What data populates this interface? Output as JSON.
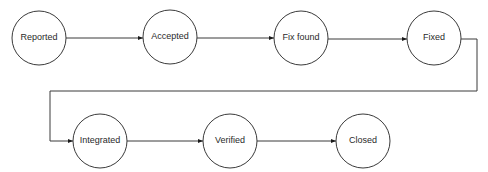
{
  "diagram": {
    "type": "state-flow",
    "nodes": [
      {
        "id": "reported",
        "label": "Reported",
        "cx": 39,
        "cy": 38,
        "r": 27
      },
      {
        "id": "accepted",
        "label": "Accepted",
        "cx": 170,
        "cy": 37,
        "r": 27
      },
      {
        "id": "fix_found",
        "label": "Fix found",
        "cx": 301,
        "cy": 38,
        "r": 27
      },
      {
        "id": "fixed",
        "label": "Fixed",
        "cx": 434,
        "cy": 38,
        "r": 27
      },
      {
        "id": "integrated",
        "label": "Integrated",
        "cx": 100,
        "cy": 141,
        "r": 27
      },
      {
        "id": "verified",
        "label": "Verified",
        "cx": 230,
        "cy": 141,
        "r": 27
      },
      {
        "id": "closed",
        "label": "Closed",
        "cx": 363,
        "cy": 141,
        "r": 27
      }
    ],
    "edges": [
      {
        "from": "reported",
        "to": "accepted"
      },
      {
        "from": "accepted",
        "to": "fix_found"
      },
      {
        "from": "fix_found",
        "to": "fixed"
      },
      {
        "from": "fixed",
        "to": "integrated"
      },
      {
        "from": "integrated",
        "to": "verified"
      },
      {
        "from": "verified",
        "to": "closed"
      }
    ]
  }
}
